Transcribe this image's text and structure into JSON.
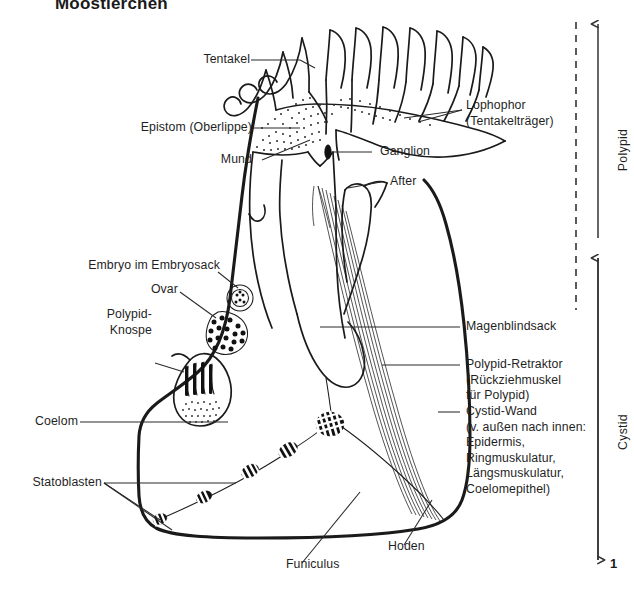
{
  "figure": {
    "title": "Moostierchen",
    "number": "1"
  },
  "brackets": [
    {
      "id": "polypid",
      "label": "Polypid"
    },
    {
      "id": "cystid",
      "label": "Cystid"
    }
  ],
  "labels_left": [
    {
      "id": "tentakel",
      "text": "Tentakel"
    },
    {
      "id": "epistom",
      "text": "Epistom (Oberlippe)"
    },
    {
      "id": "mund",
      "text": "Mund"
    },
    {
      "id": "embryo",
      "text": "Embryo im Embryosack"
    },
    {
      "id": "ovar",
      "text": "Ovar"
    },
    {
      "id": "polypid-knospe",
      "text": "Polypid-\nKnospe"
    },
    {
      "id": "coelom",
      "text": "Coelom"
    },
    {
      "id": "statoblasten",
      "text": "Statoblasten"
    },
    {
      "id": "funiculus",
      "text": "Funiculus"
    },
    {
      "id": "hoden",
      "text": "Hoden"
    }
  ],
  "labels_right": [
    {
      "id": "lophophor",
      "text": "Lophophor\n(Tentakelträger)"
    },
    {
      "id": "ganglion",
      "text": "Ganglion"
    },
    {
      "id": "after",
      "text": "After"
    },
    {
      "id": "magenblindsack",
      "text": "Magenblindsack"
    },
    {
      "id": "polypid-retraktor",
      "text": "Polypid-Retraktor\n(Rückziehmuskel\nfür Polypid)"
    },
    {
      "id": "cystid-wand",
      "text": "Cystid-Wand\n(v. außen nach innen:\nEpidermis,\nRingmuskulatur,\nLängsmuskulatur,\nCoelomepithel)"
    }
  ],
  "colors": {
    "ink": "#1a1a1a",
    "paper": "#ffffff",
    "leader": "#2a2a2a"
  }
}
